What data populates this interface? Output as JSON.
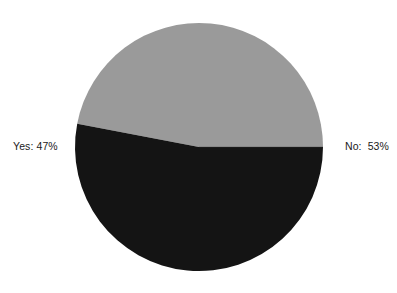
{
  "chart_data": {
    "type": "pie",
    "title": "",
    "subtitle": "",
    "xlabel": "",
    "ylabel": "",
    "grid": false,
    "legend_position": "none",
    "labels_position": "outside",
    "start_angle_deg": 0,
    "direction": "counterclockwise",
    "categories": [
      "Yes",
      "No"
    ],
    "values": [
      47,
      53
    ],
    "units": "percent",
    "slices": [
      {
        "name": "Yes",
        "label": "Yes: 47%",
        "value": 47,
        "percent": 47,
        "color": "#9a9a9a",
        "start_angle_deg": 0,
        "end_angle_deg": 169.2,
        "label_side": "left"
      },
      {
        "name": "No",
        "label": "No:  53%",
        "value": 53,
        "percent": 53,
        "color": "#141414",
        "start_angle_deg": 169.2,
        "end_angle_deg": 360,
        "label_side": "right"
      }
    ],
    "geometry": {
      "center_x": 199,
      "center_y": 147,
      "radius": 124
    },
    "colors": {
      "background": "#ffffff",
      "slice_yes": "#9a9a9a",
      "slice_no": "#141414",
      "label_text": "#1a1a1a",
      "separator": "#3a3a3a"
    }
  }
}
